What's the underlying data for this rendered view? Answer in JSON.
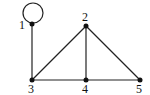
{
  "graph": {
    "nodes": [
      {
        "id": "1",
        "label": "1",
        "x": 32,
        "y": 24,
        "lx": 20,
        "ly": 28
      },
      {
        "id": "2",
        "label": "2",
        "x": 86,
        "y": 26,
        "lx": 80,
        "ly": 21
      },
      {
        "id": "3",
        "label": "3",
        "x": 32,
        "y": 80,
        "lx": 28,
        "ly": 93
      },
      {
        "id": "4",
        "label": "4",
        "x": 86,
        "y": 80,
        "lx": 82,
        "ly": 93
      },
      {
        "id": "5",
        "label": "5",
        "x": 140,
        "y": 80,
        "lx": 136,
        "ly": 93
      }
    ],
    "edges": [
      {
        "from": "1",
        "to": "1",
        "type": "loop"
      },
      {
        "from": "1",
        "to": "3"
      },
      {
        "from": "3",
        "to": "2"
      },
      {
        "from": "2",
        "to": "4"
      },
      {
        "from": "2",
        "to": "5"
      },
      {
        "from": "3",
        "to": "4"
      },
      {
        "from": "4",
        "to": "5"
      }
    ],
    "edge_color": "#222222",
    "node_color": "#111111"
  }
}
